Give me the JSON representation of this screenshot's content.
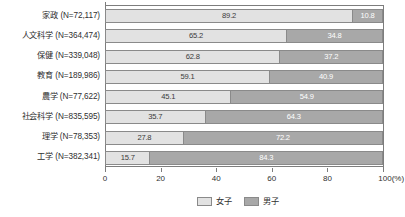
{
  "chart_data": {
    "type": "bar",
    "orientation": "horizontal",
    "stacked": true,
    "normalized_percent": true,
    "title": "",
    "subtitle": "",
    "xlabel": "",
    "ylabel": "",
    "xlim": [
      0,
      100
    ],
    "xticks": [
      0,
      20,
      40,
      60,
      80,
      100
    ],
    "xtick_labels": [
      "0",
      "20",
      "40",
      "60",
      "80",
      "100(%)"
    ],
    "grid": false,
    "legend_position": "bottom-right",
    "categories": [
      "家政 (N=72,117)",
      "人文科学 (N=364,474)",
      "保健 (N=339,048)",
      "教育 (N=189,986)",
      "農学 (N=77,622)",
      "社会科学 (N=835,595)",
      "理学 (N=78,353)",
      "工学 (N=382,341)"
    ],
    "category_names": [
      "家政",
      "人文科学",
      "保健",
      "教育",
      "農学",
      "社会科学",
      "理学",
      "工学"
    ],
    "category_counts": [
      "72,117",
      "364,474",
      "339,048",
      "189,986",
      "77,622",
      "835,595",
      "78,353",
      "382,341"
    ],
    "series": [
      {
        "name": "女子",
        "color": "#e2e2e2",
        "values": [
          89.2,
          65.2,
          62.8,
          59.1,
          45.1,
          35.7,
          27.8,
          15.7
        ],
        "labels": [
          "89.2",
          "65.2",
          "62.8",
          "59.1",
          "45.1",
          "35.7",
          "27.8",
          "15.7"
        ]
      },
      {
        "name": "男子",
        "color": "#a8a8a8",
        "values": [
          10.8,
          34.8,
          37.2,
          40.9,
          54.9,
          64.3,
          72.2,
          84.3
        ],
        "labels": [
          "10.8",
          "34.8",
          "37.2",
          "40.9",
          "54.9",
          "64.3",
          "72.2",
          "84.3"
        ]
      }
    ]
  },
  "legend": {
    "items": [
      {
        "label": "女子"
      },
      {
        "label": "男子"
      }
    ]
  },
  "colors": {
    "female": "#e2e2e2",
    "male": "#a8a8a8",
    "axis": "#7d7d7d",
    "border": "#8a8a8a",
    "text": "#2f2f2f",
    "value_text_light": "#ffffff",
    "value_text_dark": "#3a3a3a",
    "background": "#ffffff"
  }
}
